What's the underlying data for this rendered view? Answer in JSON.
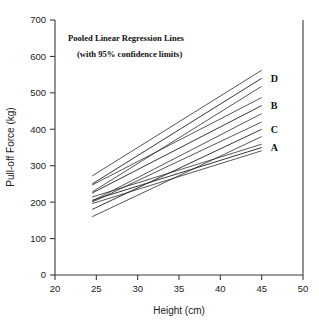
{
  "chart_data": {
    "type": "line",
    "title": "Pooled Linear Regression Lines",
    "subtitle": "(with 95% confidence limits)",
    "xlabel": "Height (cm)",
    "ylabel": "Pull-off Force (kg)",
    "xlim": [
      20,
      50
    ],
    "ylim": [
      0,
      700
    ],
    "xticks": [
      20,
      25,
      30,
      35,
      40,
      45,
      50
    ],
    "yticks": [
      0,
      100,
      200,
      300,
      400,
      500,
      600,
      700
    ],
    "grid": false,
    "legend_position": "right-inline-labels",
    "series": [
      {
        "name": "D",
        "label": "D",
        "x": [
          24.5,
          45.0
        ],
        "values": [
          250,
          540
        ],
        "ci_upper": [
          272,
          562
        ],
        "ci_lower": [
          228,
          518
        ]
      },
      {
        "name": "B",
        "label": "B",
        "x": [
          24.5,
          45.0
        ],
        "values": [
          225,
          465
        ],
        "ci_upper": [
          247,
          487
        ],
        "ci_lower": [
          203,
          443
        ]
      },
      {
        "name": "C",
        "label": "C",
        "x": [
          24.5,
          45.0
        ],
        "values": [
          180,
          400
        ],
        "ci_upper": [
          200,
          420
        ],
        "ci_lower": [
          160,
          380
        ]
      },
      {
        "name": "A",
        "label": "A",
        "x": [
          24.5,
          45.0
        ],
        "values": [
          205,
          350
        ],
        "ci_upper": [
          214,
          359
        ],
        "ci_lower": [
          196,
          341
        ]
      }
    ]
  }
}
